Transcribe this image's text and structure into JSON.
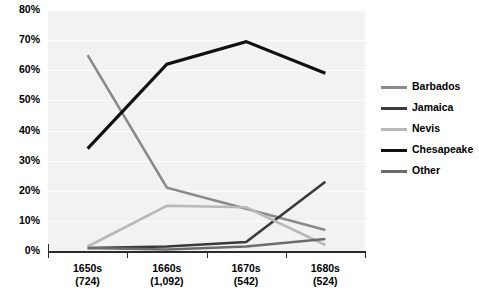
{
  "chart_data": {
    "type": "line",
    "title": "",
    "subtitle": "",
    "xlabel": "",
    "ylabel": "",
    "ylim": [
      0,
      80
    ],
    "ytick_step": 10,
    "grid": true,
    "legend_position": "right",
    "categories": [
      "1650s",
      "1660s",
      "1670s",
      "1680s"
    ],
    "category_sublabels": [
      "(724)",
      "(1,092)",
      "(542)",
      "(524)"
    ],
    "ytick_labels": [
      "80%",
      "70%",
      "60%",
      "50%",
      "40%",
      "30%",
      "20%",
      "10%",
      "0%"
    ],
    "ytick_values": [
      80,
      70,
      60,
      50,
      40,
      30,
      20,
      10,
      0
    ],
    "series": [
      {
        "name": "Barbados",
        "values": [
          65,
          21,
          14,
          7
        ],
        "color": "#8a8a8a",
        "width": 2.6
      },
      {
        "name": "Jamaica",
        "values": [
          1,
          1.5,
          3,
          23
        ],
        "color": "#3a3a3a",
        "width": 2.6
      },
      {
        "name": "Nevis",
        "values": [
          1.5,
          15,
          14.5,
          2
        ],
        "color": "#b8b8b8",
        "width": 2.6
      },
      {
        "name": "Chesapeake",
        "values": [
          34,
          62,
          69.5,
          59
        ],
        "color": "#111111",
        "width": 3.2
      },
      {
        "name": "Other",
        "values": [
          1,
          0.5,
          1.5,
          4
        ],
        "color": "#6b6b6b",
        "width": 2.6
      }
    ]
  },
  "legend": {
    "items": [
      {
        "label": "Barbados"
      },
      {
        "label": "Jamaica"
      },
      {
        "label": "Nevis"
      },
      {
        "label": "Chesapeake"
      },
      {
        "label": "Other"
      }
    ]
  },
  "colors": {
    "plot_background": "#f2f2f2",
    "gridline": "#ffffff",
    "axis": "#2b2b2b",
    "text": "#000000",
    "page_background": "#ffffff"
  }
}
